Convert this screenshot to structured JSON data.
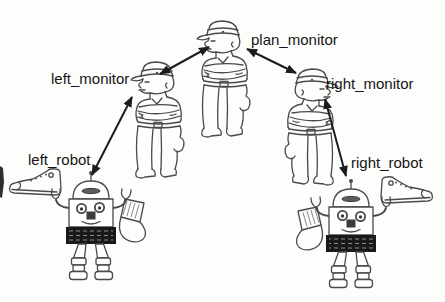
{
  "diagram": {
    "type": "agent-communication-diagram",
    "background_color": "#fdfdfc",
    "ink_color": "#4a4a4a",
    "label_color": "#151515",
    "arrow_color": "#1c1c1c",
    "nodes": [
      {
        "id": "plan_monitor",
        "label": "plan_monitor",
        "figure": "policeman-crossed-arms",
        "position": "top-center"
      },
      {
        "id": "left_monitor",
        "label": "left_monitor",
        "figure": "policeman-crossed-arms",
        "position": "middle-left"
      },
      {
        "id": "right_monitor",
        "label": "right_monitor",
        "figure": "policeman-crossed-arms-mirrored",
        "position": "middle-right"
      },
      {
        "id": "left_robot",
        "label": "left_robot",
        "figure": "robot-holding-sneaker-and-sock",
        "position": "bottom-left"
      },
      {
        "id": "right_robot",
        "label": "right_robot",
        "figure": "robot-holding-sneaker-and-sock-mirrored",
        "position": "bottom-right"
      }
    ],
    "edges": [
      {
        "from": "left_monitor",
        "to": "plan_monitor",
        "style": "double-headed-arrow"
      },
      {
        "from": "plan_monitor",
        "to": "right_monitor",
        "style": "double-headed-arrow"
      },
      {
        "from": "left_robot",
        "to": "left_monitor",
        "style": "double-headed-arrow"
      },
      {
        "from": "right_robot",
        "to": "right_monitor",
        "style": "double-headed-arrow"
      }
    ]
  }
}
